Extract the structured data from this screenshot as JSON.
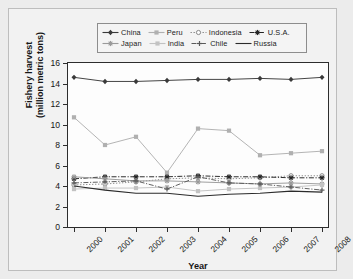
{
  "chart_data": {
    "type": "line",
    "title": "",
    "xlabel": "Year",
    "ylabel": "Fishery harvest\n(million metric tons)",
    "ylabel_line1": "Fishery harvest",
    "ylabel_line2": "(million metric tons)",
    "categories": [
      "2000",
      "2001",
      "2002",
      "2003",
      "2004",
      "2005",
      "2006",
      "2007",
      "2008"
    ],
    "x": [
      2000,
      2001,
      2002,
      2003,
      2004,
      2005,
      2006,
      2007,
      2008
    ],
    "xlim": [
      2000,
      2008
    ],
    "ylim": [
      0,
      16
    ],
    "yticks": [
      0,
      2,
      4,
      6,
      8,
      10,
      12,
      14,
      16
    ],
    "ytick_labels": [
      "0",
      "2",
      "4",
      "6",
      "8",
      "10",
      "12",
      "14",
      "16"
    ],
    "grid": false,
    "legend_position": "top",
    "series": [
      {
        "name": "China",
        "values": [
          14.6,
          14.2,
          14.2,
          14.3,
          14.4,
          14.4,
          14.5,
          14.4,
          14.6
        ],
        "color": "#3a3a3a",
        "marker": "diamond",
        "dash": "solid"
      },
      {
        "name": "Peru",
        "values": [
          10.7,
          8.0,
          8.8,
          5.3,
          9.6,
          9.4,
          7.0,
          7.2,
          7.4
        ],
        "color": "#b0b0b0",
        "marker": "square",
        "dash": "solid"
      },
      {
        "name": "Indonesia",
        "values": [
          4.1,
          4.2,
          4.4,
          4.7,
          4.8,
          4.7,
          4.8,
          5.0,
          5.0
        ],
        "color": "#8a8a8a",
        "marker": "circle-open",
        "dash": "dotted"
      },
      {
        "name": "U.S.A.",
        "values": [
          4.7,
          4.9,
          4.9,
          4.9,
          5.0,
          4.9,
          4.9,
          4.8,
          4.8
        ],
        "color": "#242424",
        "marker": "asterisk",
        "dash": "dashdot"
      },
      {
        "name": "Japan",
        "values": [
          4.9,
          4.7,
          4.5,
          4.5,
          4.4,
          4.3,
          4.2,
          4.3,
          4.2
        ],
        "color": "#9a9a9a",
        "marker": "asterisk",
        "dash": "solid"
      },
      {
        "name": "India",
        "values": [
          3.7,
          3.8,
          3.8,
          3.9,
          3.5,
          3.7,
          3.8,
          3.9,
          4.1
        ],
        "color": "#c2c2c2",
        "marker": "square",
        "dash": "solid"
      },
      {
        "name": "Chile",
        "values": [
          4.3,
          4.4,
          4.5,
          3.7,
          4.9,
          4.3,
          4.2,
          3.9,
          3.6
        ],
        "color": "#5a5a5a",
        "marker": "plus",
        "dash": "dashdot"
      },
      {
        "name": "Russia",
        "values": [
          4.0,
          3.6,
          3.3,
          3.3,
          3.0,
          3.2,
          3.3,
          3.5,
          3.4
        ],
        "color": "#2b2b2b",
        "marker": "none",
        "dash": "solid"
      }
    ]
  },
  "legend": {
    "row1": [
      "China",
      "Peru",
      "Indonesia",
      "U.S.A."
    ],
    "row2": [
      "Japan",
      "India",
      "Chile",
      "Russia"
    ]
  },
  "axis": {
    "x_title": "Year",
    "y_title_line1": "Fishery harvest",
    "y_title_line2": "(million metric tons)"
  }
}
